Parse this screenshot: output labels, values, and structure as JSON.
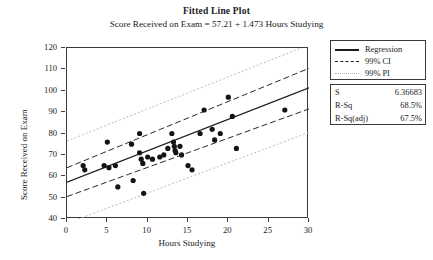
{
  "chart_data": {
    "type": "scatter",
    "title": "Fitted Line Plot",
    "subtitle": "Score Received on Exam =  57.21 + 1.473 Hours Studying",
    "xlabel": "Hours Studying",
    "ylabel": "Score Received on Exam",
    "xlim": [
      0,
      30
    ],
    "ylim": [
      40,
      120
    ],
    "xticks": [
      "0",
      "5",
      "10",
      "15",
      "20",
      "25",
      "30"
    ],
    "xtick_values": [
      0,
      5,
      10,
      15,
      20,
      25,
      30
    ],
    "yticks": [
      "40",
      "50",
      "60",
      "70",
      "80",
      "90",
      "100",
      "110",
      "120"
    ],
    "ytick_values": [
      40,
      50,
      60,
      70,
      80,
      90,
      100,
      110,
      120
    ],
    "grid": false,
    "legend_position": "right",
    "regression": {
      "intercept": 57.21,
      "slope": 1.473,
      "equation": "Score Received on Exam =  57.21 + 1.473 Hours Studying"
    },
    "points": [
      {
        "x": 2.0,
        "y": 65.0
      },
      {
        "x": 2.2,
        "y": 63.0
      },
      {
        "x": 4.6,
        "y": 65.0
      },
      {
        "x": 5.0,
        "y": 76.0
      },
      {
        "x": 5.2,
        "y": 64.0
      },
      {
        "x": 6.0,
        "y": 65.0
      },
      {
        "x": 6.3,
        "y": 55.0
      },
      {
        "x": 8.0,
        "y": 75.0
      },
      {
        "x": 8.2,
        "y": 58.0
      },
      {
        "x": 9.0,
        "y": 80.0
      },
      {
        "x": 9.0,
        "y": 71.0
      },
      {
        "x": 9.2,
        "y": 68.0
      },
      {
        "x": 9.4,
        "y": 66.0
      },
      {
        "x": 9.5,
        "y": 52.0
      },
      {
        "x": 10.0,
        "y": 69.0
      },
      {
        "x": 10.6,
        "y": 68.0
      },
      {
        "x": 11.5,
        "y": 69.0
      },
      {
        "x": 12.0,
        "y": 70.0
      },
      {
        "x": 12.5,
        "y": 73.0
      },
      {
        "x": 13.0,
        "y": 80.0
      },
      {
        "x": 13.2,
        "y": 76.0
      },
      {
        "x": 13.3,
        "y": 74.0
      },
      {
        "x": 13.4,
        "y": 72.0
      },
      {
        "x": 13.5,
        "y": 71.0
      },
      {
        "x": 14.0,
        "y": 74.0
      },
      {
        "x": 14.2,
        "y": 70.0
      },
      {
        "x": 15.0,
        "y": 65.0
      },
      {
        "x": 15.5,
        "y": 63.0
      },
      {
        "x": 16.5,
        "y": 80.0
      },
      {
        "x": 17.0,
        "y": 91.0
      },
      {
        "x": 18.0,
        "y": 82.0
      },
      {
        "x": 18.3,
        "y": 77.0
      },
      {
        "x": 19.0,
        "y": 80.0
      },
      {
        "x": 20.0,
        "y": 97.0
      },
      {
        "x": 20.5,
        "y": 88.0
      },
      {
        "x": 21.0,
        "y": 73.0
      },
      {
        "x": 27.0,
        "y": 91.0
      }
    ],
    "ci_band": {
      "label": "99% CI",
      "x": [
        0,
        30
      ],
      "lower": [
        50.5,
        91.5
      ],
      "upper": [
        64.0,
        110.5
      ]
    },
    "pi_band": {
      "label": "99% PI",
      "x": [
        0,
        30
      ],
      "lower": [
        38.0,
        80.5
      ],
      "upper": [
        76.5,
        121.5
      ]
    }
  },
  "legend": {
    "entries": [
      {
        "label": "Regression",
        "style": "solid",
        "color": "#1a1a1a"
      },
      {
        "label": "99% CI",
        "style": "dashed",
        "color": "#1a1a1a"
      },
      {
        "label": "99% PI",
        "style": "dotted",
        "color": "#b5b5b5"
      }
    ]
  },
  "stats": {
    "rows": [
      {
        "key": "S",
        "value": "6.36683"
      },
      {
        "key": "R-Sq",
        "value": "68.5%"
      },
      {
        "key": "R-Sq(adj)",
        "value": "67.5%"
      }
    ]
  },
  "colors": {
    "axis": "#3a3a3a",
    "point": "#141414",
    "regression": "#1a1a1a",
    "ci": "#2a2a2a",
    "pi": "#bdbdbd",
    "background": "#ffffff"
  }
}
